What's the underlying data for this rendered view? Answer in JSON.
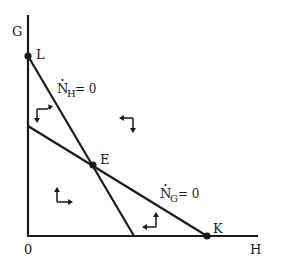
{
  "diagram": {
    "type": "phase-diagram",
    "axes": {
      "y_label": "G",
      "x_label": "H",
      "origin_label": "0"
    },
    "points": [
      {
        "id": "L",
        "label": "L"
      },
      {
        "id": "E",
        "label": "E"
      },
      {
        "id": "K",
        "label": "K"
      }
    ],
    "curves": [
      {
        "id": "NH",
        "dot_letter": "N",
        "subscript": "H",
        "suffix": "= 0",
        "description": "steep line from L to x-axis"
      },
      {
        "id": "NG",
        "dot_letter": "N",
        "subscript": "G",
        "suffix": "= 0",
        "description": "shallow line from G-axis to K"
      }
    ],
    "direction_arrows": [
      {
        "region": "upper-left",
        "directions": [
          "down",
          "right"
        ]
      },
      {
        "region": "upper-right",
        "directions": [
          "left",
          "down"
        ]
      },
      {
        "region": "lower-left",
        "directions": [
          "up",
          "right"
        ]
      },
      {
        "region": "lower-right",
        "directions": [
          "left",
          "up"
        ]
      }
    ]
  }
}
